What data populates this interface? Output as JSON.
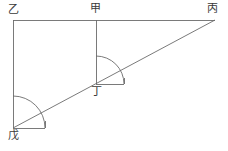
{
  "figure": {
    "stroke_color": "#6b6b6b",
    "label_color": "#3a3a3a",
    "background_color": "#ffffff",
    "stroke_width": 0.9
  },
  "labels": {
    "yi": "乙",
    "jia": "甲",
    "bing": "丙",
    "ding": "丁",
    "wu": "戊"
  },
  "points": {
    "yi": {
      "x": 13,
      "y": 20
    },
    "jia": {
      "x": 96,
      "y": 20
    },
    "bing": {
      "x": 215,
      "y": 20
    },
    "ding": {
      "x": 96,
      "y": 84
    },
    "wu": {
      "x": 13,
      "y": 128
    }
  },
  "segments": [
    {
      "name": "top-horizontal-yi-to-bing",
      "x1": 13,
      "y1": 20,
      "x2": 215,
      "y2": 20
    },
    {
      "name": "left-vertical-yi-to-wu",
      "x1": 13,
      "y1": 20,
      "x2": 13,
      "y2": 128
    },
    {
      "name": "vertical-jia-to-ding",
      "x1": 96,
      "y1": 20,
      "x2": 96,
      "y2": 84
    },
    {
      "name": "diagonal-wu-to-bing",
      "x1": 13,
      "y1": 128,
      "x2": 215,
      "y2": 20
    },
    {
      "name": "angle-base-tick-at-wu",
      "x1": 13,
      "y1": 128,
      "x2": 45,
      "y2": 128
    },
    {
      "name": "angle-end-tick-at-wu",
      "x1": 45,
      "y1": 128,
      "x2": 45,
      "y2": 121
    },
    {
      "name": "angle-base-tick-at-ding",
      "x1": 96,
      "y1": 84,
      "x2": 124,
      "y2": 84
    },
    {
      "name": "angle-end-tick-at-ding",
      "x1": 124,
      "y1": 84,
      "x2": 124,
      "y2": 78
    }
  ],
  "arcs": [
    {
      "name": "angle-arc-at-wu",
      "center_x": 13,
      "center_y": 128,
      "radius": 32,
      "start_x": 13,
      "start_y": 96,
      "end_x": 45,
      "end_y": 128,
      "start_angle_deg": -90,
      "end_angle_deg": 0,
      "sweep": 1
    },
    {
      "name": "angle-arc-at-ding",
      "center_x": 96,
      "center_y": 84,
      "radius": 28,
      "start_x": 96,
      "start_y": 56,
      "end_x": 124,
      "end_y": 84,
      "start_angle_deg": -90,
      "end_angle_deg": 0,
      "sweep": 1
    }
  ]
}
